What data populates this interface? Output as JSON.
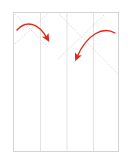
{
  "page": {
    "width": 130,
    "height": 161,
    "background_color": "#ffffff",
    "header_text": "· ·· ···· ·· ·"
  },
  "canvas": {
    "label": "document-page-preview",
    "border_color": "#d4d4d4",
    "fill_color": "#ffffff",
    "x": 13,
    "y": 12,
    "width": 106,
    "height": 140
  },
  "column_rules": {
    "label": "vertical-column-guides",
    "color": "#e3e3e3",
    "count": 3,
    "positions_pct": [
      25,
      50,
      75
    ]
  },
  "guide_lines": {
    "label": "dotted-diagonal-guides",
    "color": "#cfcfcf",
    "style": "dotted",
    "items": [
      {
        "name": "diagonal-down-right-left",
        "x1": 1,
        "y1": 1,
        "x2": 34,
        "y2": 34
      },
      {
        "name": "diagonal-up-right-left",
        "x1": 1,
        "y1": 30,
        "x2": 32,
        "y2": 1
      },
      {
        "name": "diagonal-down-right-center",
        "x1": 45,
        "y1": 1,
        "x2": 104,
        "y2": 60
      },
      {
        "name": "diagonal-up-right-center",
        "x1": 45,
        "y1": 45,
        "x2": 92,
        "y2": 1
      }
    ]
  },
  "annotations": {
    "label": "red-curved-arrows",
    "color": "#e02718",
    "arrows": [
      {
        "name": "arrow-left",
        "path": "M 3 17 C 14 6, 26 12, 34 26",
        "head_x": 34,
        "head_y": 27,
        "head_angle": 62
      },
      {
        "name": "arrow-right",
        "path": "M 100 20 C 88 14, 72 22, 62 45",
        "head_x": 61,
        "head_y": 46,
        "head_angle": 110
      }
    ]
  }
}
